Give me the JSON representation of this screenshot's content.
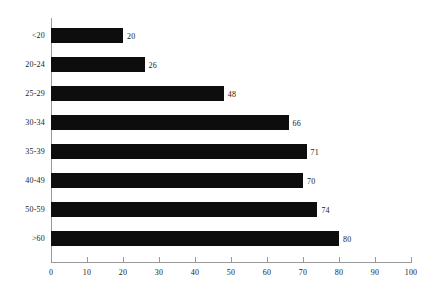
{
  "chart_data": {
    "type": "bar",
    "orientation": "horizontal",
    "title": "",
    "subtitle": "",
    "xlabel": "",
    "ylabel": "",
    "categories": [
      "<20",
      "20-24",
      "25-29",
      "30-34",
      "35-39",
      "40-49",
      "50-59",
      ">60"
    ],
    "values": [
      20,
      26,
      48,
      66,
      71,
      70,
      74,
      80
    ],
    "data_labels": [
      "20",
      "26",
      "48",
      "66",
      "71",
      "70",
      "74",
      "80"
    ],
    "xlim": [
      0,
      100
    ],
    "xticks": [
      0,
      10,
      20,
      30,
      40,
      50,
      60,
      70,
      80,
      90,
      100
    ],
    "xtick_labels": [
      "0",
      "10",
      "20",
      "30",
      "40",
      "50",
      "60",
      "70",
      "80",
      "90",
      "100"
    ],
    "grid": false,
    "legend": false,
    "legend_position": "none",
    "bar_color": "#0d0d0d",
    "axis_color": "#9a9a9a",
    "text_color": "#1a1a1a",
    "background_color": "#ffffff"
  }
}
